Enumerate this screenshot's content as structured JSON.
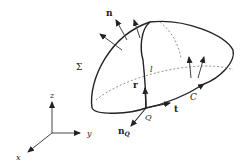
{
  "diagram": {
    "labels": {
      "normal": "n",
      "surface": "Σ",
      "curve_on_surface": "l",
      "position_vector": "r",
      "point": "Q",
      "tangent": "t",
      "boundary": "C",
      "point_normal": "n",
      "point_normal_sub": "Q",
      "axis_z": "z",
      "axis_y": "y",
      "axis_x": "x"
    },
    "colors": {
      "stroke": "#222222",
      "hidden": "#888888",
      "background": "#ffffff"
    }
  }
}
